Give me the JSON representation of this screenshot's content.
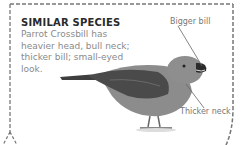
{
  "panel": {
    "title": "SIMILAR SPECIES",
    "description": "Parrot Crossbill has heavier head, bull neck; thicker bill; small-eyed look."
  },
  "annotations": {
    "bill": "Bigger bill",
    "neck": "Thicker neck"
  },
  "image": {
    "subject": "Parrot Crossbill illustration"
  },
  "colors": {
    "border": "#777777",
    "title": "#2a2a2a",
    "text": "#8a8a8a",
    "bird_body": "#8a8a8a",
    "bird_wing": "#4a4a4a"
  }
}
